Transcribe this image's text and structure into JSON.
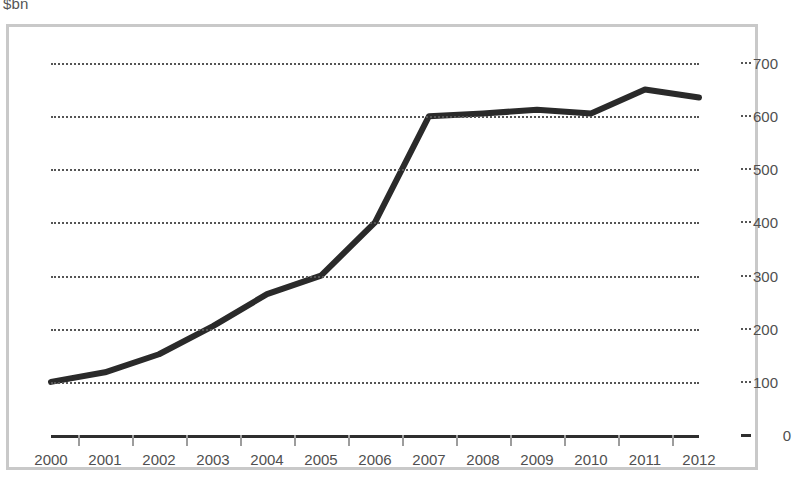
{
  "unit_label": "$bn",
  "colors": {
    "line": "#2a2a2a",
    "grid": "#555555",
    "frame": "#c9c9c9",
    "axis": "#2e2e2e",
    "text": "#4f4f4f",
    "background": "#ffffff"
  },
  "chart_data": {
    "type": "line",
    "title": "",
    "subtitle": "",
    "xlabel": "",
    "ylabel": "$bn",
    "categories": [
      "2000",
      "2001",
      "2002",
      "2003",
      "2004",
      "2005",
      "2006",
      "2007",
      "2008",
      "2009",
      "2010",
      "2011",
      "2012"
    ],
    "x": [
      2000,
      2001,
      2002,
      2003,
      2004,
      2005,
      2006,
      2007,
      2008,
      2009,
      2010,
      2011,
      2012
    ],
    "values": [
      100,
      118,
      152,
      205,
      265,
      300,
      400,
      600,
      605,
      612,
      605,
      650,
      635
    ],
    "series": [
      {
        "name": "",
        "values": [
          100,
          118,
          152,
          205,
          265,
          300,
          400,
          600,
          605,
          612,
          605,
          650,
          635
        ]
      }
    ],
    "ylim": [
      0,
      700
    ],
    "yticks": [
      0,
      100,
      200,
      300,
      400,
      500,
      600,
      700
    ],
    "ytick_labels": [
      "0",
      "100",
      "200",
      "300",
      "400",
      "500",
      "600",
      "700"
    ],
    "xlim": [
      2000,
      2012
    ],
    "grid": true,
    "grid_style": "dotted-horizontal",
    "legend": false,
    "legend_position": "none",
    "y_axis_position": "right",
    "line_width": 6,
    "markers": false
  }
}
